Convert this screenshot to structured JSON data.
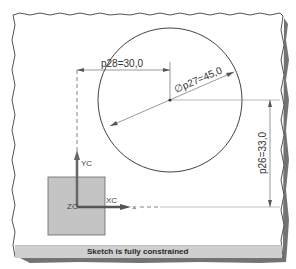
{
  "sketch": {
    "circle": {
      "cx": 170,
      "cy": 100,
      "r": 72
    },
    "dimensions": {
      "horizontal": {
        "label": "p28=30,0",
        "name": "p28",
        "value": "30,0"
      },
      "diameter": {
        "label": "∅p27=45,0",
        "name": "p27",
        "value": "45,0"
      },
      "vertical": {
        "label": "p26=33,0",
        "name": "p26",
        "value": "33,0"
      }
    },
    "csys": {
      "x_label": "XC",
      "y_label": "YC",
      "z_label": "ZC",
      "point_marker": "×"
    }
  },
  "status_bar": {
    "message": "Sketch is fully constrained"
  },
  "colors": {
    "frame_shadow": "#555555",
    "status_bg": "#cfcfcf",
    "csys_square": "#c4c4c4",
    "axis": "#555555",
    "dimension_line": "#444444",
    "circle_stroke": "#444444"
  }
}
